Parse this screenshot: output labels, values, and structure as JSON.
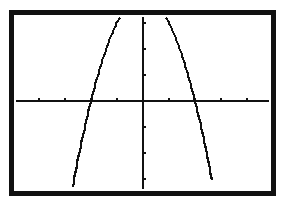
{
  "chart_data": {
    "type": "line",
    "title": "",
    "xlabel": "",
    "ylabel": "",
    "function": "y = 4 - x^2",
    "xlim": [
      -4.7,
      4.7
    ],
    "ylim": [
      -3.2,
      3.2
    ],
    "x_tick_step": 1,
    "y_tick_step": 1,
    "grid": false,
    "legend": null,
    "series": [
      {
        "name": "curve",
        "x": [
          -2.7,
          -2.5,
          -2.25,
          -2.0,
          -1.75,
          -1.5,
          -1.25,
          -1.0,
          -0.9
        ],
        "y": [
          -3.29,
          -2.25,
          -1.06,
          0.0,
          0.94,
          1.75,
          2.44,
          3.0,
          3.19
        ]
      },
      {
        "name": "curve-right",
        "x": [
          0.9,
          1.0,
          1.25,
          1.5,
          1.75,
          2.0,
          2.25,
          2.5,
          2.65
        ],
        "y": [
          3.19,
          3.0,
          2.44,
          1.75,
          0.94,
          0.0,
          -1.06,
          -2.25,
          -3.02
        ]
      }
    ],
    "x_intercepts": [
      -2,
      2
    ],
    "colors": {
      "axis": "#111111",
      "curve": "#111111",
      "border": "#111111",
      "background": "#ffffff"
    }
  },
  "screen": {
    "caption": "Graphing calculator screen showing parabola"
  }
}
